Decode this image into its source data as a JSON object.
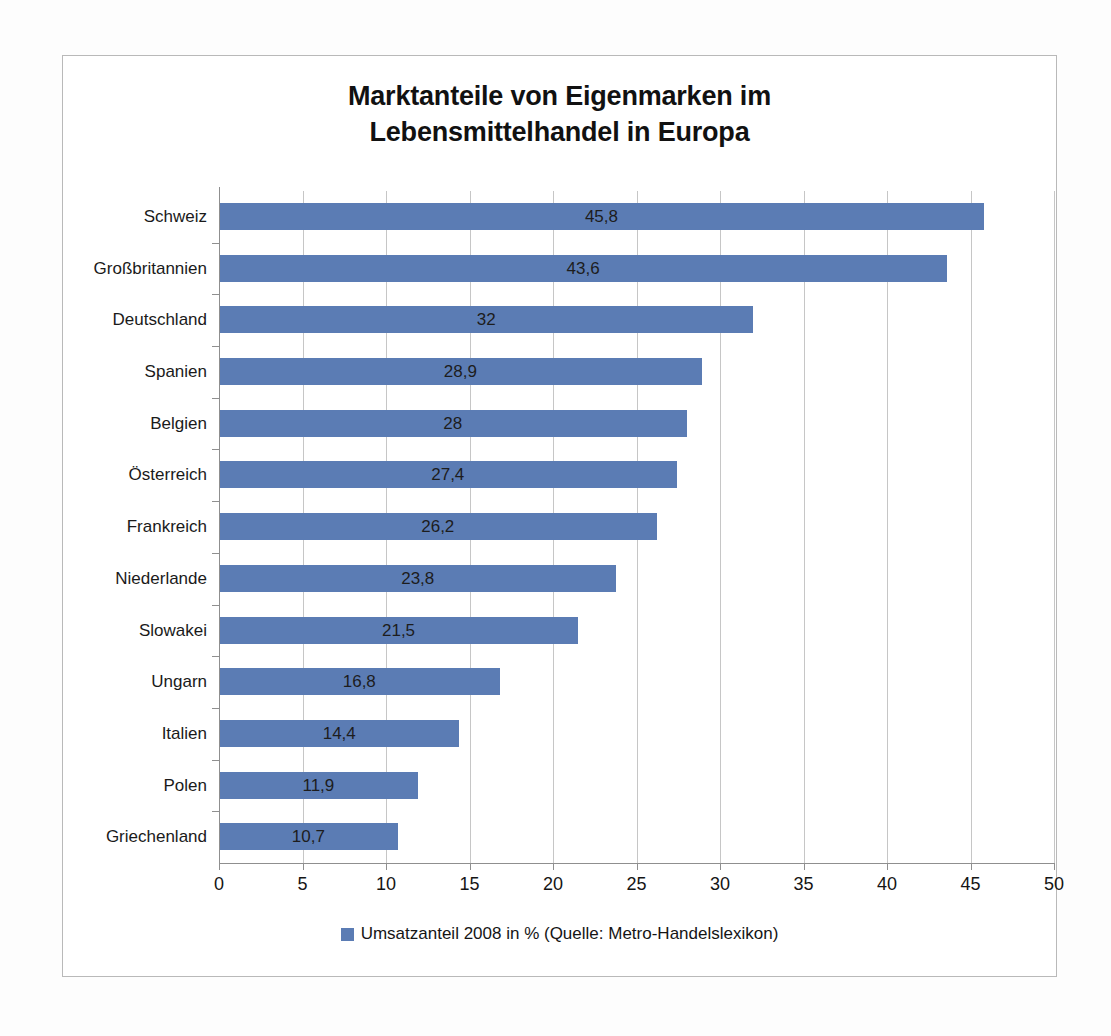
{
  "chart_data": {
    "type": "bar",
    "orientation": "horizontal",
    "title": "Marktanteile von Eigenmarken im Lebensmittelhandel in Europa",
    "title_lines": [
      "Marktanteile von Eigenmarken im",
      "Lebensmittelhandel in Europa"
    ],
    "categories": [
      "Schweiz",
      "Großbritannien",
      "Deutschland",
      "Spanien",
      "Belgien",
      "Österreich",
      "Frankreich",
      "Niederlande",
      "Slowakei",
      "Ungarn",
      "Italien",
      "Polen",
      "Griechenland"
    ],
    "values": [
      45.8,
      43.6,
      32,
      28.9,
      28,
      27.4,
      26.2,
      23.8,
      21.5,
      16.8,
      14.4,
      11.9,
      10.7
    ],
    "value_labels": [
      "45,8",
      "43,6",
      "32",
      "28,9",
      "28",
      "27,4",
      "26,2",
      "23,8",
      "21,5",
      "16,8",
      "14,4",
      "11,9",
      "10,7"
    ],
    "xlabel": "",
    "ylabel": "",
    "xlim": [
      0,
      50
    ],
    "xticks": [
      0,
      5,
      10,
      15,
      20,
      25,
      30,
      35,
      40,
      45,
      50
    ],
    "xtick_labels": [
      "0",
      "5",
      "10",
      "15",
      "20",
      "25",
      "30",
      "35",
      "40",
      "45",
      "50"
    ],
    "grid": "vertical",
    "legend_position": "bottom",
    "series": [
      {
        "name": "Umsatzanteil 2008 in % (Quelle: Metro-Handelslexikon)",
        "color": "#5b7cb4",
        "values": [
          45.8,
          43.6,
          32,
          28.9,
          28,
          27.4,
          26.2,
          23.8,
          21.5,
          16.8,
          14.4,
          11.9,
          10.7
        ]
      }
    ]
  },
  "legend": {
    "label": "Umsatzanteil 2008 in % (Quelle: Metro-Handelslexikon)",
    "swatch_color": "#5b7cb4"
  },
  "colors": {
    "bar": "#5b7cb4",
    "gridline": "#c6c6c6",
    "axis": "#8f8f8f",
    "text": "#151515",
    "frame": "#b9b9b9",
    "background": "#ffffff"
  }
}
